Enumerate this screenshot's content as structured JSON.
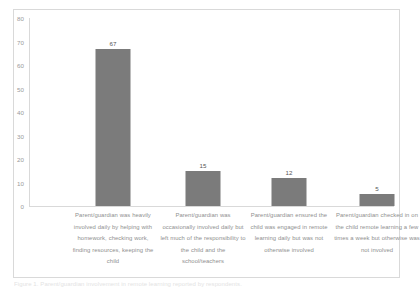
{
  "chart_data": {
    "type": "bar",
    "title": "",
    "subtitle": "",
    "xlabel": "",
    "ylabel": "",
    "ylim": [
      0,
      80
    ],
    "ytick_step": 10,
    "grid": false,
    "legend": false,
    "bar_color": "#7b7b7b",
    "axis_color": "#d9d9d9",
    "label_color": "#8f8f8f",
    "yticks": [
      "80",
      "70",
      "60",
      "50",
      "40",
      "30",
      "20",
      "10",
      "0"
    ],
    "ytick_values": [
      80,
      70,
      60,
      50,
      40,
      30,
      20,
      10,
      0
    ],
    "categories": [
      "Parent/guardian was heavily involved daily by helping with homework, checking work, finding resources, keeping the child",
      "Parent/guardian was occasionally involved daily but left much of the responsibility to the child and the school/teachers",
      "Parent/guardian ensured the child was engaged in remote learning daily but was not otherwise involved",
      "Parent/guardian checked in on the child remote learning a few times a week but otherwise was not involved"
    ],
    "values": [
      67,
      15,
      12,
      5
    ],
    "value_labels": [
      "67",
      "15",
      "12",
      "5"
    ]
  },
  "caption": {
    "bottom_cutoff_text": "Figure 1. Parent/guardian involvement in remote learning reported by respondents."
  }
}
